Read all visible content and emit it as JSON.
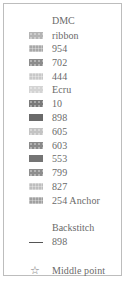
{
  "legend": {
    "dmc_heading": "DMC",
    "threads": [
      {
        "label": "ribbon",
        "color": "#b4b4b4",
        "pattern": "dots"
      },
      {
        "label": "954",
        "color": "#a8a8a8",
        "pattern": "grid"
      },
      {
        "label": "702",
        "color": "#8c8c8c",
        "pattern": "dots"
      },
      {
        "label": "444",
        "color": "#c8c8c8",
        "pattern": "grid"
      },
      {
        "label": "Ecru",
        "color": "#d4d4d4",
        "pattern": "dots"
      },
      {
        "label": "10",
        "color": "#7a7a7a",
        "pattern": "dots"
      },
      {
        "label": "898",
        "color": "#6a6a6a",
        "pattern": "solid"
      },
      {
        "label": "605",
        "color": "#c4c4c4",
        "pattern": "dots"
      },
      {
        "label": "603",
        "color": "#8a8a8a",
        "pattern": "dots"
      },
      {
        "label": "553",
        "color": "#747474",
        "pattern": "solid"
      },
      {
        "label": "799",
        "color": "#8e8e8e",
        "pattern": "dots"
      },
      {
        "label": "827",
        "color": "#bebebe",
        "pattern": "grid"
      },
      {
        "label": "254 Anchor",
        "color": "#a0a0a0",
        "pattern": "grid"
      }
    ],
    "backstitch_heading": "Backstitch",
    "backstitch": {
      "label": "898",
      "color": "#555555"
    },
    "middle_point": {
      "icon": "star-outline-icon",
      "label": "Middle point"
    }
  }
}
